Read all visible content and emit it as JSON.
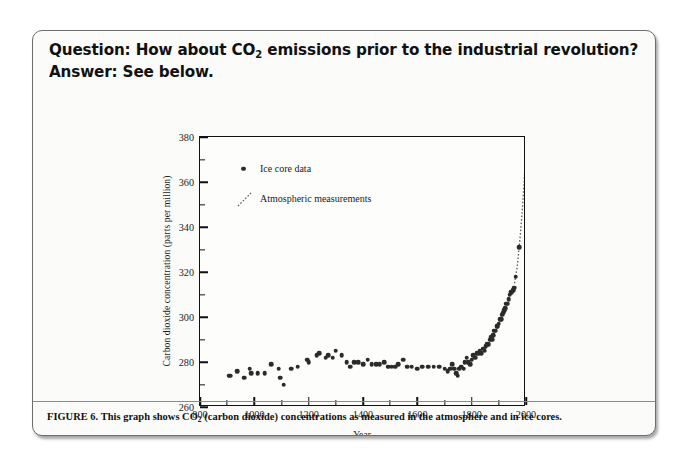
{
  "slide": {
    "question_prefix": "Question: How about CO",
    "question_sub": "2",
    "question_suffix": " emissions prior to the industrial revolution?",
    "answer_line": "Answer: See below."
  },
  "caption": {
    "prefix": "FIGURE 6. This graph shows CO",
    "sub": "2",
    "suffix": " (carbon dioxide) concentrations as measured in the atmosphere and in ice cores."
  },
  "legend": {
    "items": [
      {
        "label": "Ice core data",
        "marker": "dot-marker",
        "color": "#2b2b2b"
      },
      {
        "label": "Atmospheric measurements",
        "marker": "dotted-line-marker",
        "color": "#555555"
      }
    ]
  },
  "chart_data": {
    "type": "scatter",
    "title": "",
    "xlabel": "Year",
    "ylabel": "Carbon dioxide concentration (parts per million)",
    "xlim": [
      800,
      2000
    ],
    "ylim": [
      260,
      380
    ],
    "xticks": [
      800,
      1000,
      1200,
      1400,
      1600,
      1800,
      2000
    ],
    "xminor_step": 100,
    "yticks": [
      260,
      280,
      300,
      320,
      340,
      360,
      380
    ],
    "yminor_step": 10,
    "grid": false,
    "legend_position": "top-left-inside",
    "series": [
      {
        "name": "Ice core data",
        "type": "scatter",
        "color": "#2b2b2b",
        "points": [
          [
            905,
            274
          ],
          [
            912,
            274
          ],
          [
            938,
            276
          ],
          [
            962,
            273
          ],
          [
            983,
            277
          ],
          [
            988,
            275
          ],
          [
            1012,
            275
          ],
          [
            1038,
            275
          ],
          [
            1062,
            279
          ],
          [
            1090,
            277
          ],
          [
            1095,
            273
          ],
          [
            1108,
            270
          ],
          [
            1135,
            277
          ],
          [
            1160,
            278
          ],
          [
            1195,
            281
          ],
          [
            1200,
            280
          ],
          [
            1230,
            283
          ],
          [
            1238,
            284
          ],
          [
            1262,
            282
          ],
          [
            1272,
            283
          ],
          [
            1288,
            282
          ],
          [
            1300,
            285
          ],
          [
            1322,
            283
          ],
          [
            1340,
            280
          ],
          [
            1352,
            278
          ],
          [
            1368,
            280
          ],
          [
            1382,
            280
          ],
          [
            1400,
            279
          ],
          [
            1418,
            281
          ],
          [
            1432,
            279
          ],
          [
            1448,
            279
          ],
          [
            1462,
            279
          ],
          [
            1478,
            280
          ],
          [
            1492,
            278
          ],
          [
            1505,
            278
          ],
          [
            1518,
            278
          ],
          [
            1530,
            279
          ],
          [
            1548,
            281
          ],
          [
            1562,
            278
          ],
          [
            1580,
            278
          ],
          [
            1600,
            277
          ],
          [
            1618,
            278
          ],
          [
            1640,
            278
          ],
          [
            1660,
            278
          ],
          [
            1680,
            278
          ],
          [
            1700,
            277
          ],
          [
            1712,
            276
          ],
          [
            1720,
            277
          ],
          [
            1728,
            279
          ],
          [
            1735,
            277
          ],
          [
            1742,
            275
          ],
          [
            1748,
            274
          ],
          [
            1755,
            277
          ],
          [
            1762,
            278
          ],
          [
            1770,
            277
          ],
          [
            1775,
            280
          ],
          [
            1782,
            282
          ],
          [
            1788,
            280
          ],
          [
            1795,
            279
          ],
          [
            1800,
            281
          ],
          [
            1806,
            283
          ],
          [
            1812,
            282
          ],
          [
            1818,
            284
          ],
          [
            1824,
            284
          ],
          [
            1830,
            285
          ],
          [
            1836,
            284
          ],
          [
            1842,
            286
          ],
          [
            1848,
            285
          ],
          [
            1852,
            287
          ],
          [
            1858,
            288
          ],
          [
            1862,
            288
          ],
          [
            1868,
            290
          ],
          [
            1872,
            291
          ],
          [
            1876,
            290
          ],
          [
            1880,
            292
          ],
          [
            1884,
            294
          ],
          [
            1888,
            294
          ],
          [
            1892,
            296
          ],
          [
            1896,
            296
          ],
          [
            1900,
            297
          ],
          [
            1904,
            299
          ],
          [
            1908,
            299
          ],
          [
            1912,
            301
          ],
          [
            1916,
            302
          ],
          [
            1920,
            303
          ],
          [
            1924,
            304
          ],
          [
            1928,
            306
          ],
          [
            1932,
            306
          ],
          [
            1936,
            308
          ],
          [
            1940,
            310
          ],
          [
            1944,
            311
          ],
          [
            1948,
            311
          ],
          [
            1952,
            312
          ],
          [
            1956,
            313
          ],
          [
            1962,
            318
          ],
          [
            1975,
            331
          ]
        ]
      },
      {
        "name": "Atmospheric measurements",
        "type": "line",
        "style": "dotted",
        "color": "#555555",
        "points": [
          [
            1958,
            315
          ],
          [
            1962,
            318
          ],
          [
            1966,
            321
          ],
          [
            1970,
            325
          ],
          [
            1974,
            330
          ],
          [
            1978,
            335
          ],
          [
            1982,
            341
          ],
          [
            1986,
            347
          ],
          [
            1990,
            354
          ],
          [
            1993,
            360
          ],
          [
            1996,
            367
          ],
          [
            1999,
            375
          ]
        ]
      }
    ]
  }
}
